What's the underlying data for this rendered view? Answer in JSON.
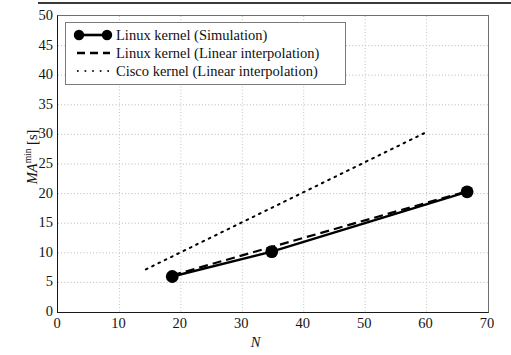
{
  "chart_data": {
    "type": "line",
    "title": "",
    "xlabel": "N",
    "ylabel": "MA^min [s]",
    "ylabel_base": "MA",
    "ylabel_sup": "min",
    "ylabel_unit": " [s]",
    "xlim": [
      0,
      70
    ],
    "ylim": [
      0,
      50
    ],
    "xticks": [
      0,
      10,
      20,
      30,
      40,
      50,
      60,
      70
    ],
    "yticks": [
      0,
      5,
      10,
      15,
      20,
      25,
      30,
      35,
      40,
      45,
      50
    ],
    "grid": "dotted-both",
    "legend_position": "upper-left-inside",
    "series": [
      {
        "name": "Linux kernel (Simulation)",
        "style": "solid-with-round-markers",
        "color": "#000000",
        "x": [
          18.6,
          34.8,
          66.6
        ],
        "y": [
          6.0,
          10.2,
          20.3
        ]
      },
      {
        "name": "Linux kernel (Linear interpolation)",
        "style": "dashed",
        "color": "#000000",
        "x": [
          18.6,
          66.6
        ],
        "y": [
          6.2,
          20.4
        ]
      },
      {
        "name": "Cisco kernel (Linear interpolation)",
        "style": "dotted",
        "color": "#000000",
        "x": [
          14.3,
          60.0
        ],
        "y": [
          7.2,
          30.4
        ]
      }
    ]
  },
  "legend": {
    "items": [
      {
        "label": "Linux kernel (Simulation)",
        "sample": "solid-line-with-markers"
      },
      {
        "label": "Linux kernel (Linear interpolation)",
        "sample": "dashed-line"
      },
      {
        "label": "Cisco kernel (Linear interpolation)",
        "sample": "dotted-line"
      }
    ]
  }
}
